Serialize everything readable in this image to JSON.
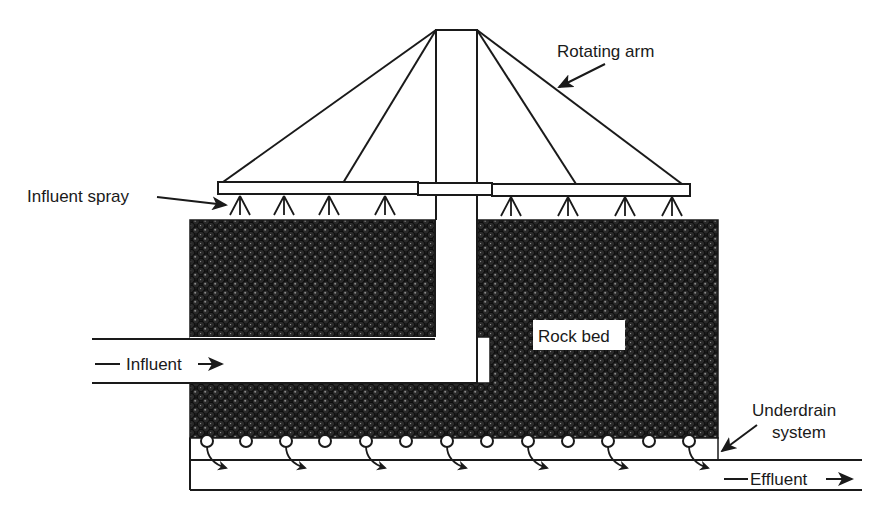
{
  "diagram": {
    "labels": {
      "rotating_arm": "Rotating arm",
      "influent_spray": "Influent spray",
      "rock_bed": "Rock bed",
      "influent": "Influent",
      "underdrain_line1": "Underdrain",
      "underdrain_line2": "system",
      "effluent": "Effluent"
    },
    "components": [
      {
        "id": "rotating-arm",
        "type": "distributor"
      },
      {
        "id": "spray-nozzles",
        "count": 8
      },
      {
        "id": "rock-bed",
        "type": "media"
      },
      {
        "id": "influent-pipe",
        "type": "inlet"
      },
      {
        "id": "underdrain-system",
        "openings": 13
      },
      {
        "id": "effluent-channel",
        "type": "outlet"
      }
    ],
    "colors": {
      "line": "#1a1a1a",
      "rock": "#1a1a1a",
      "background": "#ffffff"
    }
  }
}
